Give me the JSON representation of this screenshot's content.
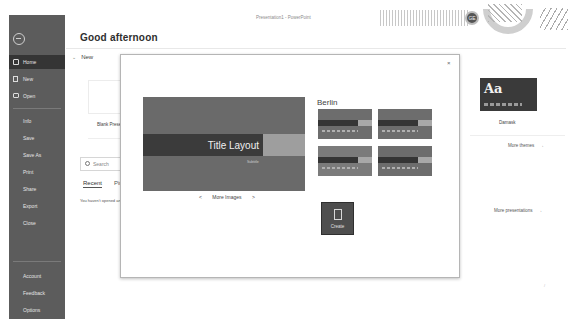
{
  "window": {
    "title": "Presentation1 - PowerPoint"
  },
  "header": {
    "greeting": "Good afternoon",
    "avatar_initials": "GE"
  },
  "sidebar": {
    "items": [
      {
        "label": "Home",
        "active": true
      },
      {
        "label": "New"
      },
      {
        "label": "Open"
      },
      {
        "label": "Info"
      },
      {
        "label": "Save"
      },
      {
        "label": "Save As"
      },
      {
        "label": "Print"
      },
      {
        "label": "Share"
      },
      {
        "label": "Export"
      },
      {
        "label": "Close"
      }
    ],
    "bottom_items": [
      {
        "label": "Account"
      },
      {
        "label": "Feedback"
      },
      {
        "label": "Options"
      }
    ]
  },
  "main": {
    "new_section_label": "New",
    "blank_presentation_label": "Blank Presentation",
    "search_placeholder": "Search",
    "tabs": [
      {
        "label": "Recent"
      },
      {
        "label": "Pinned"
      }
    ],
    "empty_message": "You haven't opened any presentations recently.",
    "right_theme_label": "Damask",
    "right_theme_glyph": "Aa",
    "more_themes_label": "More themes",
    "more_presentations_label": "More presentations",
    "arrow_glyph": "→"
  },
  "dialog": {
    "close_glyph": "×",
    "preview_title": "Title Layout",
    "preview_subtitle": "Subtitle",
    "prev_glyph": "<",
    "more_images_label": "More Images",
    "next_glyph": ">",
    "theme_name": "Berlin",
    "variants": [
      {
        "id": 1
      },
      {
        "id": 2
      },
      {
        "id": 3
      },
      {
        "id": 4
      }
    ],
    "create_label": "Create"
  },
  "colors": {
    "sidebar_bg": "#5c5c5c",
    "sidebar_active": "#353535",
    "preview_bg": "#6a6a6a",
    "create_btn": "#4e4e4e"
  }
}
